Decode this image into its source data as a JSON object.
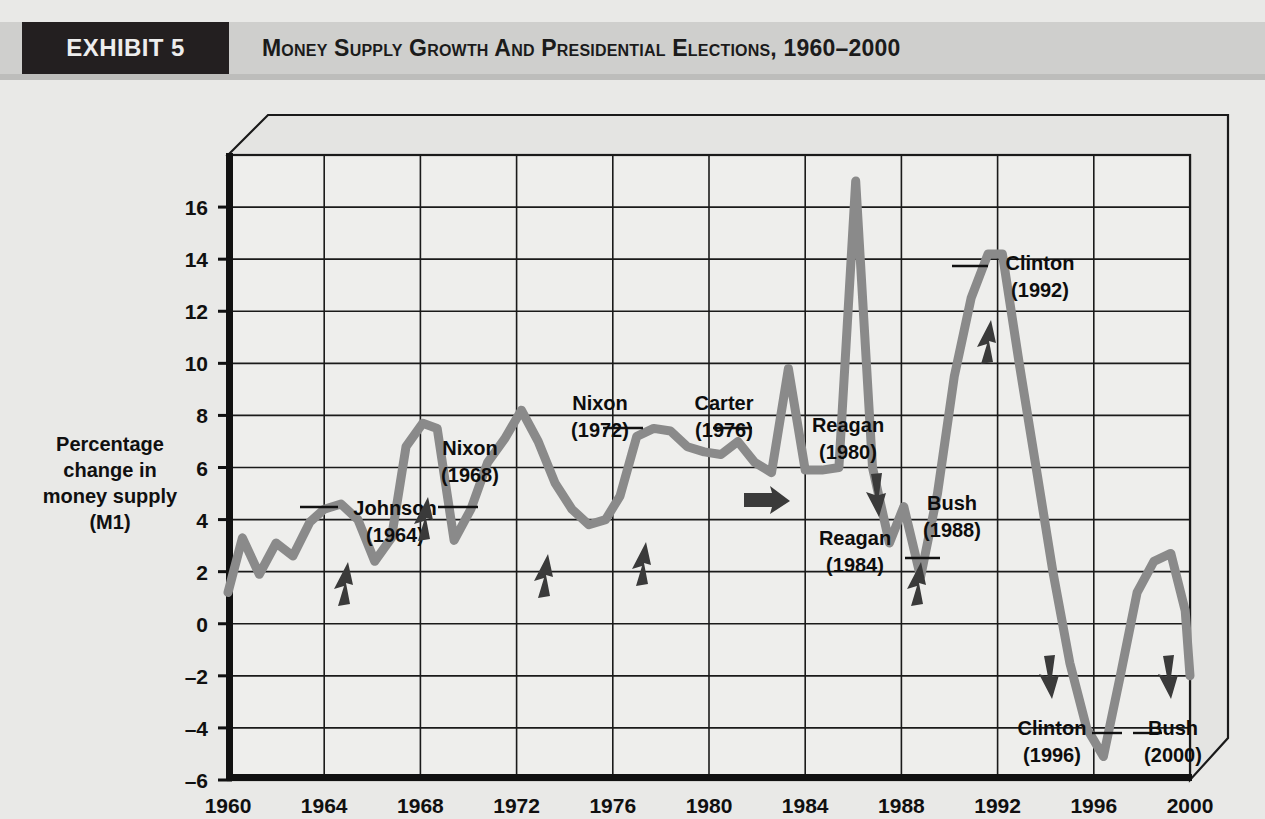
{
  "header": {
    "exhibit_tag": "EXHIBIT 5",
    "title": "Money Supply Growth and Presidential Elections, 1960–2000",
    "tag_bg": "#231f20",
    "band_bg": "#cfcfcd"
  },
  "chart_data": {
    "type": "line",
    "title": "Money Supply Growth and Presidential Elections, 1960–2000",
    "xlabel": "Presidential election year",
    "ylabel": "Percentage change in money supply (M1)",
    "ylabel_lines": [
      "Percentage",
      "change in",
      "money supply",
      "(M1)"
    ],
    "xlim": [
      1960,
      2000
    ],
    "ylim": [
      -6,
      18
    ],
    "y_ticks": [
      16,
      14,
      12,
      10,
      8,
      6,
      4,
      2,
      0,
      -2,
      -4,
      -6
    ],
    "x_ticks": [
      1960,
      1964,
      1968,
      1972,
      1976,
      1980,
      1984,
      1988,
      1992,
      1996,
      2000
    ],
    "grid": true,
    "legend": "none",
    "line_color": "#8a8a8a",
    "series": [
      {
        "name": "Percentage change in money supply (M1)",
        "x": [
          1960.0,
          1960.6,
          1961.3,
          1962.0,
          1962.7,
          1963.4,
          1964.0,
          1964.7,
          1965.4,
          1966.1,
          1966.8,
          1967.4,
          1968.1,
          1968.7,
          1969.4,
          1970.1,
          1970.8,
          1971.5,
          1972.2,
          1972.9,
          1973.6,
          1974.3,
          1975.0,
          1975.7,
          1976.3,
          1977.0,
          1977.7,
          1978.4,
          1979.1,
          1979.8,
          1980.5,
          1981.2,
          1981.9,
          1982.6,
          1983.3,
          1984.0,
          1984.7,
          1985.4,
          1986.1,
          1986.8,
          1987.5,
          1988.1,
          1988.8,
          1989.5,
          1990.2,
          1990.9,
          1991.6,
          1992.2,
          1992.9,
          1993.6,
          1994.3,
          1995.0,
          1995.7,
          1996.4,
          1997.1,
          1997.8,
          1998.5,
          1999.2,
          1999.8,
          2000.0
        ],
        "y": [
          1.2,
          3.3,
          1.9,
          3.1,
          2.6,
          3.9,
          4.4,
          4.6,
          4.0,
          2.4,
          3.3,
          6.8,
          7.7,
          7.5,
          3.2,
          4.4,
          6.2,
          7.1,
          8.2,
          7.0,
          5.4,
          4.4,
          3.8,
          4.0,
          4.9,
          7.2,
          7.5,
          7.4,
          6.8,
          6.6,
          6.5,
          7.0,
          6.2,
          5.8,
          9.8,
          5.9,
          5.9,
          6.0,
          17.0,
          6.0,
          3.1,
          4.5,
          1.8,
          5.0,
          9.5,
          12.5,
          14.2,
          14.2,
          10.0,
          6.0,
          2.0,
          -1.5,
          -4.0,
          -5.1,
          -2.0,
          1.2,
          2.4,
          2.7,
          0.5,
          -2.0
        ]
      }
    ],
    "annotations": [
      {
        "id": "johnson-1964",
        "name": "Johnson",
        "year": "(1964)",
        "direction": "up",
        "label_x": 395,
        "label_y": 435,
        "arrow_x": 345,
        "arrow_y": 500,
        "leader": {
          "x1": 300,
          "y1": 427,
          "x2": 338,
          "y2": 427
        }
      },
      {
        "id": "nixon-1968",
        "name": "Nixon",
        "year": "(1968)",
        "direction": "up",
        "label_x": 470,
        "label_y": 375,
        "arrow_x": 425,
        "arrow_y": 435,
        "leader": {
          "x1": 438,
          "y1": 427,
          "x2": 478,
          "y2": 427
        }
      },
      {
        "id": "nixon-1972",
        "name": "Nixon",
        "year": "(1972)",
        "direction": "up",
        "label_x": 600,
        "label_y": 330,
        "arrow_x": 545,
        "arrow_y": 492,
        "leader": {
          "x1": 603,
          "y1": 348,
          "x2": 643,
          "y2": 348
        }
      },
      {
        "id": "carter-1976",
        "name": "Carter",
        "year": "(1976)",
        "direction": "up",
        "label_x": 724,
        "label_y": 330,
        "arrow_x": 643,
        "arrow_y": 480,
        "leader": {
          "x1": 713,
          "y1": 348,
          "x2": 752,
          "y2": 348
        }
      },
      {
        "id": "reagan-1980",
        "name": "Reagan",
        "year": "(1980)",
        "direction": "right",
        "label_x": 848,
        "label_y": 352,
        "arrow_x": 768,
        "arrow_y": 420,
        "leader": null
      },
      {
        "id": "reagan-1984",
        "name": "Reagan",
        "year": "(1984)",
        "direction": "down",
        "label_x": 855,
        "label_y": 465,
        "arrow_x": 877,
        "arrow_y": 418,
        "leader": {
          "x1": 905,
          "y1": 478,
          "x2": 940,
          "y2": 478
        }
      },
      {
        "id": "bush-1988",
        "name": "Bush",
        "year": "(1988)",
        "direction": "up",
        "label_x": 952,
        "label_y": 430,
        "arrow_x": 918,
        "arrow_y": 500,
        "leader": null
      },
      {
        "id": "clinton-1992",
        "name": "Clinton",
        "year": "(1992)",
        "direction": "up",
        "label_x": 1040,
        "label_y": 190,
        "arrow_x": 988,
        "arrow_y": 258,
        "leader": {
          "x1": 952,
          "y1": 186,
          "x2": 988,
          "y2": 186
        }
      },
      {
        "id": "clinton-1996",
        "name": "Clinton",
        "year": "(1996)",
        "direction": "down",
        "label_x": 1052,
        "label_y": 655,
        "arrow_x": 1050,
        "arrow_y": 600,
        "leader": {
          "x1": 1092,
          "y1": 653,
          "x2": 1122,
          "y2": 653
        }
      },
      {
        "id": "bush-2000",
        "name": "Bush",
        "year": "(2000)",
        "direction": "down",
        "label_x": 1173,
        "label_y": 655,
        "arrow_x": 1169,
        "arrow_y": 600,
        "leader": {
          "x1": 1133,
          "y1": 653,
          "x2": 1162,
          "y2": 653
        }
      }
    ]
  }
}
